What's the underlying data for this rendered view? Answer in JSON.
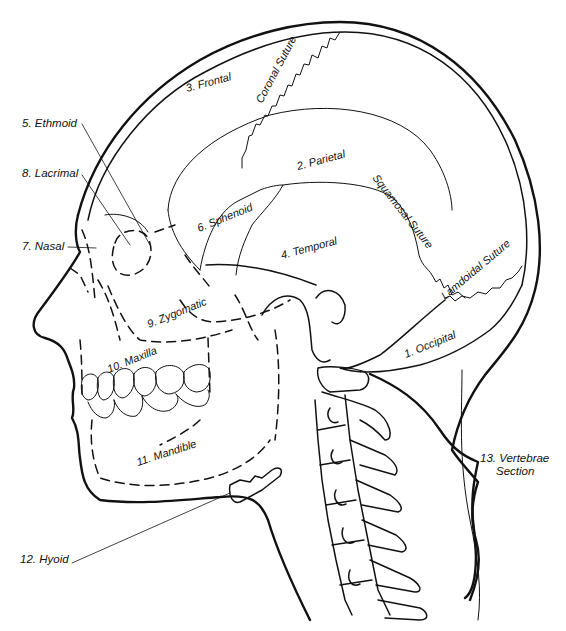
{
  "diagram": {
    "ink_color": "#111111",
    "background": "#ffffff",
    "labels": {
      "occipital": "1. Occipital",
      "parietal": "2. Parietal",
      "frontal": "3. Frontal",
      "temporal": "4. Temporal",
      "ethmoid": "5. Ethmoid",
      "sphenoid": "6. Sphenoid",
      "nasal": "7. Nasal",
      "lacrimal": "8. Lacrimal",
      "zygomatic": "9. Zygomatic",
      "maxilla": "10. Maxilla",
      "mandible": "11. Mandible",
      "hyoid": "12. Hyoid",
      "vertebrae_line1": "13. Vertebrae",
      "vertebrae_line2": "Section"
    },
    "sutures": {
      "coronal": "Coronal Suture",
      "squamosal": "Squamosal Suture",
      "lamdoidal": "Lamdoidal Suture"
    }
  }
}
